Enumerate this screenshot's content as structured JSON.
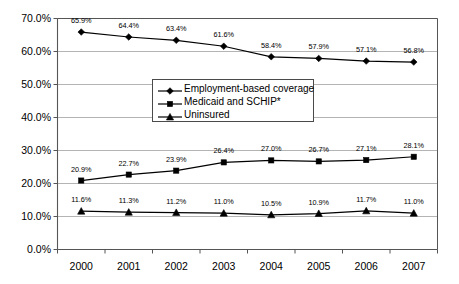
{
  "chart_data": {
    "type": "line",
    "title": "",
    "subtitle": "",
    "xlabel": "",
    "ylabel": "",
    "categories": [
      "2000",
      "2001",
      "2002",
      "2003",
      "2004",
      "2005",
      "2006",
      "2007"
    ],
    "ylim": [
      0,
      70
    ],
    "y_ticks": [
      "0.0%",
      "10.0%",
      "20.0%",
      "30.0%",
      "40.0%",
      "50.0%",
      "60.0%",
      "70.0%"
    ],
    "y_tick_values": [
      0,
      10,
      20,
      30,
      40,
      50,
      60,
      70
    ],
    "grid": true,
    "grid_axis": "y",
    "legend_position": "center",
    "series": [
      {
        "name": "Employment-based coverage",
        "marker": "diamond",
        "color": "#000000",
        "values": [
          65.9,
          64.4,
          63.4,
          61.6,
          58.4,
          57.9,
          57.1,
          56.8
        ],
        "labels": [
          "65.9%",
          "64.4%",
          "63.4%",
          "61.6%",
          "58.4%",
          "57.9%",
          "57.1%",
          "56.8%"
        ]
      },
      {
        "name": "Medicaid and SCHIP*",
        "marker": "square",
        "color": "#000000",
        "values": [
          20.9,
          22.7,
          23.9,
          26.4,
          27.0,
          26.7,
          27.1,
          28.1
        ],
        "labels": [
          "20.9%",
          "22.7%",
          "23.9%",
          "26.4%",
          "27.0%",
          "26.7%",
          "27.1%",
          "28.1%"
        ]
      },
      {
        "name": "Uninsured",
        "marker": "triangle",
        "color": "#000000",
        "values": [
          11.6,
          11.3,
          11.2,
          11.0,
          10.5,
          10.9,
          11.7,
          11.0
        ],
        "labels": [
          "11.6%",
          "11.3%",
          "11.2%",
          "11.0%",
          "10.5%",
          "10.9%",
          "11.7%",
          "11.0%"
        ]
      }
    ]
  },
  "legend": {
    "items": [
      {
        "label": "Employment-based coverage",
        "marker": "diamond"
      },
      {
        "label": "Medicaid and SCHIP*",
        "marker": "square"
      },
      {
        "label": "Uninsured",
        "marker": "triangle"
      }
    ]
  },
  "colors": {
    "series": "#000000",
    "grid": "#b4b4b4",
    "axis": "#555555",
    "background": "#ffffff"
  }
}
